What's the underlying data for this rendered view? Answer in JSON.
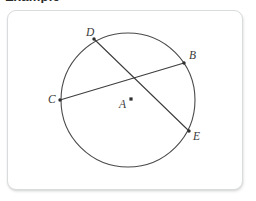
{
  "page": {
    "background_color": "#ffffff",
    "cropped_heading_text": "Example"
  },
  "card": {
    "background_color": "#ffffff",
    "border_color": "#d9dcdd",
    "corner_radius_px": 9
  },
  "figure": {
    "type": "circle-geometry-diagram",
    "stroke_color": "#3d3d3d",
    "circle": {
      "center_label": "A",
      "center_x": 127,
      "center_y": 99,
      "radius": 67
    },
    "center_point": {
      "label": "A",
      "label_x": 118,
      "label_y": 107,
      "dot_x": 130,
      "dot_y": 98
    },
    "points": [
      {
        "label": "D",
        "x": 93,
        "y": 38,
        "label_x": 85,
        "label_y": 35
      },
      {
        "label": "B",
        "x": 183,
        "y": 62,
        "label_x": 188,
        "label_y": 58
      },
      {
        "label": "C",
        "x": 59,
        "y": 99,
        "label_x": 47,
        "label_y": 102
      },
      {
        "label": "E",
        "x": 188,
        "y": 130,
        "label_x": 192,
        "label_y": 139
      }
    ],
    "chords": [
      {
        "name": "chord-CB",
        "from": "C",
        "to": "B",
        "x1": 59,
        "y1": 99,
        "x2": 183,
        "y2": 62
      },
      {
        "name": "chord-DE",
        "from": "D",
        "to": "E",
        "x1": 93,
        "y1": 38,
        "x2": 188,
        "y2": 130
      }
    ]
  }
}
